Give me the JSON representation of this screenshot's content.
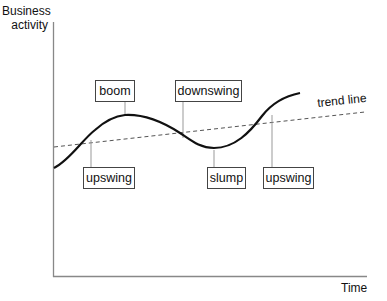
{
  "diagram": {
    "y_axis_label_line1": "Business",
    "y_axis_label_line2": "activity",
    "x_axis_label": "Time",
    "trend_label": "trend line",
    "phases": {
      "boom": "boom",
      "downswing": "downswing",
      "upswing1": "upswing",
      "slump": "slump",
      "upswing2": "upswing"
    },
    "colors": {
      "curve": "#111111",
      "axis": "#888888",
      "trend": "#555555",
      "leader": "#999999"
    }
  }
}
